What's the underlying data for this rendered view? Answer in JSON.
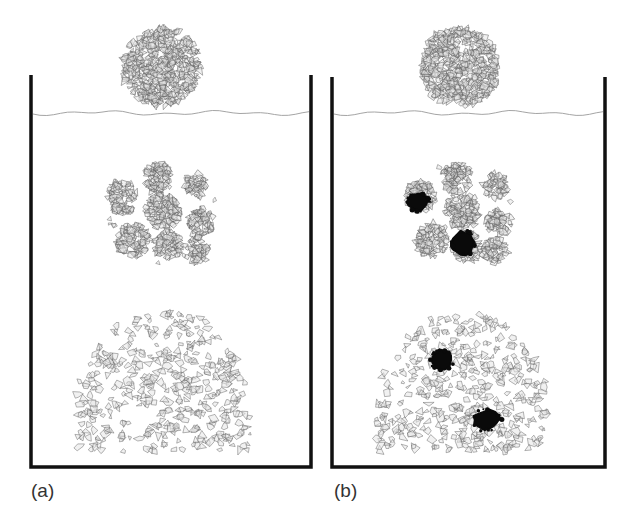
{
  "figure": {
    "panels": [
      {
        "id": "a",
        "label": "(a)",
        "container": {
          "left_x": 31,
          "right_x": 311,
          "top_y": 75,
          "bottom_y": 467,
          "wall_width": 3.5,
          "wall_color": "#111111"
        },
        "water_line": {
          "y": 113,
          "color": "#9a9a9a"
        },
        "sphere": {
          "cx": 161,
          "cy": 67,
          "r": 42,
          "description": "intact aggregate above water"
        },
        "fragmented_cluster": {
          "cx": 162,
          "cy": 212,
          "r": 56,
          "description": "aggregate breaking into sub-clumps",
          "clumps": [
            {
              "cx": 122,
              "cy": 197,
              "r": 15
            },
            {
              "cx": 158,
              "cy": 178,
              "r": 15
            },
            {
              "cx": 196,
              "cy": 186,
              "r": 12
            },
            {
              "cx": 163,
              "cy": 211,
              "r": 17
            },
            {
              "cx": 200,
              "cy": 222,
              "r": 13
            },
            {
              "cx": 133,
              "cy": 240,
              "r": 16
            },
            {
              "cx": 168,
              "cy": 246,
              "r": 14
            },
            {
              "cx": 196,
              "cy": 250,
              "r": 12
            }
          ],
          "black_blobs": []
        },
        "dispersed_pile": {
          "left": 78,
          "right": 250,
          "top": 313,
          "bottom": 452,
          "description": "fully dispersed fragments settled at bottom",
          "black_blobs": []
        }
      },
      {
        "id": "b",
        "label": "(b)",
        "container": {
          "left_x": 332,
          "right_x": 605,
          "top_y": 77,
          "bottom_y": 467,
          "wall_width": 3.5,
          "wall_color": "#111111"
        },
        "water_line": {
          "y": 113,
          "color": "#9a9a9a"
        },
        "sphere": {
          "cx": 460,
          "cy": 67,
          "r": 42,
          "description": "intact aggregate above water"
        },
        "fragmented_cluster": {
          "cx": 461,
          "cy": 212,
          "r": 56,
          "description": "aggregate breaking into sub-clumps with non-dispersing dark lumps",
          "clumps": [
            {
              "cx": 421,
              "cy": 197,
              "r": 15
            },
            {
              "cx": 457,
              "cy": 178,
              "r": 15
            },
            {
              "cx": 495,
              "cy": 186,
              "r": 12
            },
            {
              "cx": 462,
              "cy": 211,
              "r": 17
            },
            {
              "cx": 499,
              "cy": 222,
              "r": 13
            },
            {
              "cx": 432,
              "cy": 240,
              "r": 16
            },
            {
              "cx": 467,
              "cy": 246,
              "r": 14
            },
            {
              "cx": 495,
              "cy": 250,
              "r": 12
            }
          ],
          "black_blobs": [
            {
              "cx": 418,
              "cy": 202,
              "rx": 11,
              "ry": 9
            },
            {
              "cx": 463,
              "cy": 243,
              "rx": 11,
              "ry": 12
            }
          ]
        },
        "dispersed_pile": {
          "left": 376,
          "right": 548,
          "top": 315,
          "bottom": 452,
          "description": "dispersed fragments with undispersed dark lumps",
          "black_blobs": [
            {
              "cx": 442,
              "cy": 360,
              "rx": 11,
              "ry": 10
            },
            {
              "cx": 486,
              "cy": 420,
              "rx": 14,
              "ry": 10
            }
          ]
        }
      }
    ],
    "colors": {
      "background": "#ffffff",
      "fragment_stroke": "#555555",
      "fragment_fill": "#e6e6e6",
      "black_blob": "#0a0a0a",
      "label": "#333333"
    }
  }
}
